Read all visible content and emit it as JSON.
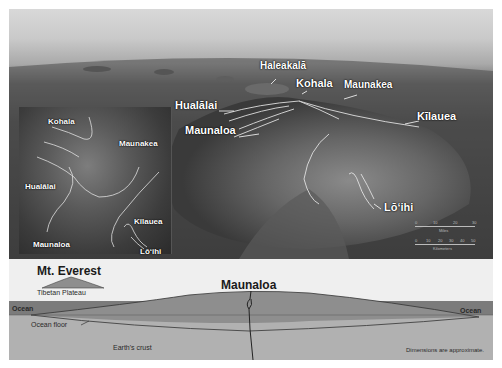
{
  "photo": {
    "main_labels": {
      "haleakala": "Haleakalā",
      "kohala": "Kohala",
      "maunakea": "Maunakea",
      "hualalai": "Hualālai",
      "maunaloa": "Maunaloa",
      "kilauea": "Kīlauea",
      "loihi": "Lō‘ihi"
    },
    "inset_labels": {
      "kohala": "Kohala",
      "maunakea": "Maunakea",
      "hualalai": "Hualālai",
      "kilauea": "Kīlauea",
      "maunaloa": "Maunaloa",
      "loihi": "Lō‘ihi"
    },
    "scale_bars": {
      "miles": {
        "unit": "Miles",
        "ticks": [
          "0",
          "10",
          "20",
          "30"
        ]
      },
      "kilometers": {
        "unit": "Kilometers",
        "ticks": [
          "0",
          "10",
          "20",
          "30",
          "40",
          "50"
        ]
      }
    }
  },
  "cross_section": {
    "everest_title": "Mt. Everest",
    "tibetan_plateau": "Tibetan Plateau",
    "maunaloa_title": "Maunaloa",
    "ocean_left": "Ocean",
    "ocean_right": "Ocean",
    "ocean_floor": "Ocean floor",
    "earths_crust": "Earth's crust",
    "note": "Dimensions are approximate."
  },
  "colors": {
    "ocean": "#7b7b7b",
    "volcano_body": "#8e8e8e",
    "crust": "#b1b1b1",
    "diagram_bg": "#efefef",
    "label": "#ffffff"
  }
}
